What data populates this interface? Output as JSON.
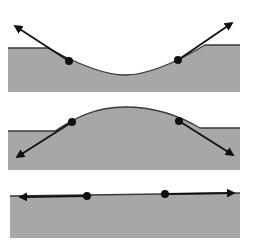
{
  "colors": {
    "background": "#ffffff",
    "ground_fill": "#a9a9a9",
    "surface_line": "#3a3a3a",
    "arrow": "#111111",
    "dot": "#111111"
  },
  "panels": [
    {
      "id": "concave",
      "description": "Concave (dipped) surface with outward-pointing arrows at two points",
      "left_x": 8,
      "right_x": 240,
      "bottom_y": 92,
      "surface_path": "M8 48 L48 48 C70 60 100 75 125 75 C150 75 180 60 205 45 L240 45",
      "points": [
        {
          "x": 69,
          "y": 61,
          "arrow_to": {
            "x": 15,
            "y": 26
          }
        },
        {
          "x": 178,
          "y": 60,
          "arrow_to": {
            "x": 232,
            "y": 23
          }
        }
      ]
    },
    {
      "id": "convex",
      "description": "Convex (bulged) surface with arrows pointing down into the ground",
      "left_x": 8,
      "right_x": 240,
      "bottom_y": 170,
      "surface_path": "M8 131 L55 131 C75 118 95 107 125 107 C155 107 180 116 200 128 L240 128",
      "points": [
        {
          "x": 72,
          "y": 122,
          "arrow_to": {
            "x": 17,
            "y": 157
          }
        },
        {
          "x": 179,
          "y": 121,
          "arrow_to": {
            "x": 233,
            "y": 155
          }
        }
      ]
    },
    {
      "id": "flat",
      "description": "Flat surface with arrows pointing horizontally along the surface",
      "left_x": 10,
      "right_x": 240,
      "bottom_y": 238,
      "surface_path": "M10 196 L240 193",
      "points": [
        {
          "x": 87,
          "y": 196,
          "arrow_to": {
            "x": 20,
            "y": 197
          }
        },
        {
          "x": 165,
          "y": 194,
          "arrow_to": {
            "x": 234,
            "y": 193
          }
        }
      ]
    }
  ]
}
